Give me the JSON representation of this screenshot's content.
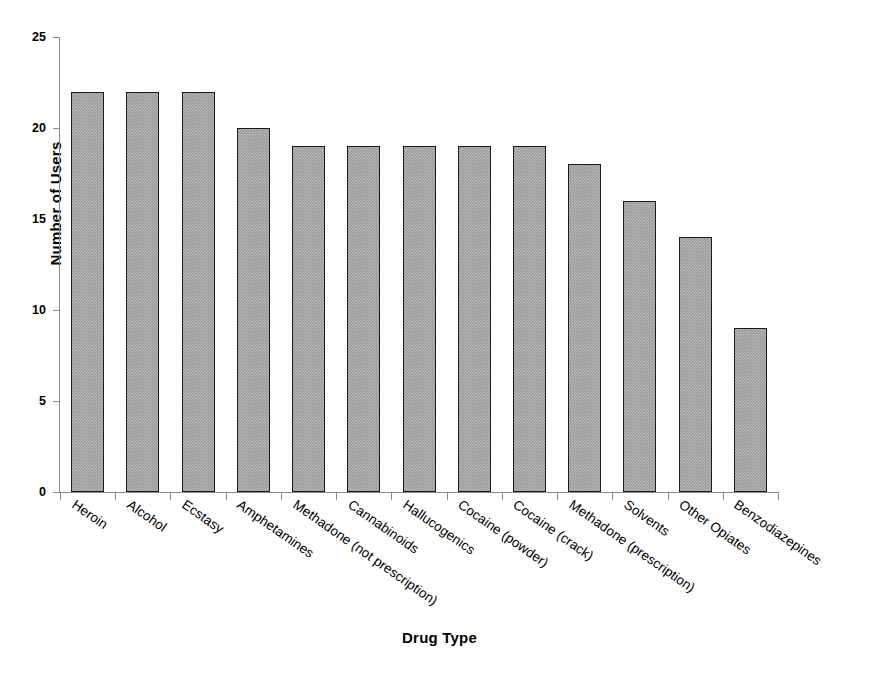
{
  "chart_data": {
    "type": "bar",
    "title": "",
    "xlabel": "Drug Type",
    "ylabel": "Number of Users",
    "categories": [
      "Heroin",
      "Alcohol",
      "Ecstasy",
      "Amphetamines",
      "Methadone (not prescription)",
      "Cannabinoids",
      "Hallucogenics",
      "Cocaine (powder)",
      "Cocaine (crack)",
      "Methadone (prescription)",
      "Solvents",
      "Other Opiates",
      "Benzodiazepines"
    ],
    "values": [
      22,
      22,
      22,
      20,
      19,
      19,
      19,
      19,
      19,
      18,
      16,
      14,
      9
    ],
    "ylim": [
      0,
      25
    ],
    "ytick_values": [
      0,
      5,
      10,
      15,
      20,
      25
    ],
    "ytick_labels": [
      "0",
      "5",
      "10",
      "15",
      "20",
      "25"
    ],
    "grid": false,
    "legend": false,
    "bar_fill_color": "#9a9a9a",
    "bar_border_color": "#1a1a1a",
    "axis_color": "#8a8a8a",
    "background_color": "#ffffff",
    "xlabel_rotation_deg": -35
  }
}
